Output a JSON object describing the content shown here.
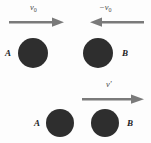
{
  "figure": {
    "background_color": "#fdfdfd",
    "ball_color": "#2e2e2e",
    "arrow_color": "#7a7a7a",
    "label_color": "#1d1d1d",
    "width": 151,
    "height": 143
  },
  "panels": [
    {
      "name": "before-collision",
      "balls": [
        {
          "label": "A",
          "cx": 33,
          "cy": 53,
          "r": 15
        },
        {
          "label": "B",
          "cx": 98,
          "cy": 53,
          "r": 15
        }
      ],
      "vectors": [
        {
          "label": "v",
          "subscript": "0",
          "sign": "",
          "direction": "right",
          "x1": 10,
          "x2": 64,
          "y": 22
        },
        {
          "label": "v",
          "subscript": "0",
          "sign": "−",
          "direction": "left",
          "x1": 87,
          "x2": 143,
          "y": 22
        }
      ]
    },
    {
      "name": "after-collision",
      "balls": [
        {
          "label": "A",
          "cx": 60,
          "cy": 123,
          "r": 14
        },
        {
          "label": "B",
          "cx": 105,
          "cy": 123,
          "r": 14
        }
      ],
      "vectors": [
        {
          "label": "v′",
          "subscript": "",
          "sign": "",
          "direction": "right",
          "x1": 82,
          "x2": 145,
          "y": 99
        }
      ]
    }
  ],
  "labels": {
    "top_left_vector": "v",
    "top_left_vector_sub": "0",
    "top_right_vector_sign": "−",
    "top_right_vector": "v",
    "top_right_vector_sub": "0",
    "bottom_vector": "v′",
    "top_ball_a": "A",
    "top_ball_b": "B",
    "bottom_ball_a": "A",
    "bottom_ball_b": "B"
  }
}
